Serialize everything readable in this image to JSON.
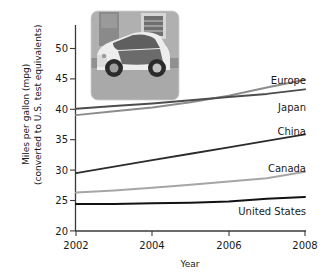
{
  "chart_data": {
    "type": "line",
    "title": "",
    "xlabel": "Year",
    "ylabel": "Miles per gallon (mpg)",
    "ylabel_line2": "(converted to U.S. test equivalents)",
    "xlim": [
      2002,
      2008
    ],
    "ylim": [
      20,
      52
    ],
    "xticks": [
      2002,
      2004,
      2006,
      2008
    ],
    "xtick_labels": [
      "2002",
      "2004",
      "2006",
      "2008"
    ],
    "yticks": [
      20,
      25,
      30,
      35,
      40,
      45,
      50
    ],
    "ytick_labels": [
      "20",
      "25",
      "30",
      "35",
      "40",
      "45",
      "50"
    ],
    "grid": false,
    "legend_position": "right-inline",
    "x": [
      2002,
      2003,
      2004,
      2005,
      2006,
      2007,
      2008
    ],
    "series": [
      {
        "name": "Europe",
        "label": "Europe",
        "color": "#8c8c8c",
        "width": 2.0,
        "values": [
          38.0,
          38.6,
          39.2,
          40.0,
          41.0,
          42.3,
          43.5
        ]
      },
      {
        "name": "Japan",
        "label": "Japan",
        "color": "#4d4d4d",
        "width": 2.0,
        "values": [
          39.0,
          39.4,
          39.8,
          40.3,
          40.8,
          41.3,
          42.0
        ]
      },
      {
        "name": "China",
        "label": "China",
        "color": "#2b2b2b",
        "width": 1.8,
        "values": [
          29.0,
          30.0,
          31.0,
          32.0,
          33.0,
          34.0,
          35.0
        ]
      },
      {
        "name": "Canada",
        "label": "Canada",
        "color": "#a6a6a6",
        "width": 2.0,
        "values": [
          26.0,
          26.3,
          26.7,
          27.2,
          27.7,
          28.2,
          29.2
        ]
      },
      {
        "name": "United States",
        "label": "United States",
        "color": "#121212",
        "width": 2.0,
        "values": [
          24.2,
          24.2,
          24.3,
          24.4,
          24.6,
          25.0,
          25.3
        ]
      }
    ]
  },
  "inset": {
    "name": "smart-car-photo",
    "alt": "Photograph of a small two-seat Smart car parked on a street",
    "colors": {
      "sky_wall": "#b9b9b9",
      "wall_dark": "#8f8f8f",
      "road": "#a8a8a8",
      "car_body": "#ededed",
      "car_glass": "#5c5c5c",
      "tire": "#2e2e2e"
    }
  },
  "figure": {
    "background": "#ffffff",
    "axis_color": "#3a3a3a",
    "text_color": "#1a1a1a"
  }
}
